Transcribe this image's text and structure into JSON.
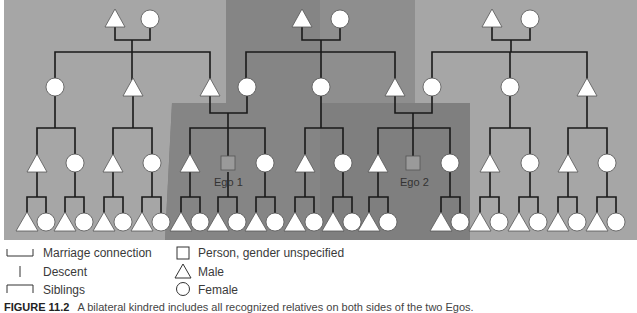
{
  "diagram": {
    "colors": {
      "outer_bg": "#a8a8a8",
      "mid_bg": "#8c8c8c",
      "inner_bg": "#7a7a7a",
      "line": "#1a1a1a",
      "symbol_fill": "#ffffff",
      "ego_fill": "#9a9a9a"
    },
    "ego_labels": [
      "Ego 1",
      "Ego 2"
    ]
  },
  "legend": {
    "items": [
      {
        "symbol": "marriage-connection",
        "label": "Marriage connection"
      },
      {
        "symbol": "descent",
        "label": "Descent"
      },
      {
        "symbol": "siblings",
        "label": "Siblings"
      },
      {
        "symbol": "square",
        "label": "Person, gender unspecified"
      },
      {
        "symbol": "triangle",
        "label": "Male"
      },
      {
        "symbol": "circle",
        "label": "Female"
      }
    ]
  },
  "caption": {
    "number": "FIGURE 11.2",
    "text": "A bilateral kindred includes all recognized relatives on both sides of the two Egos."
  }
}
